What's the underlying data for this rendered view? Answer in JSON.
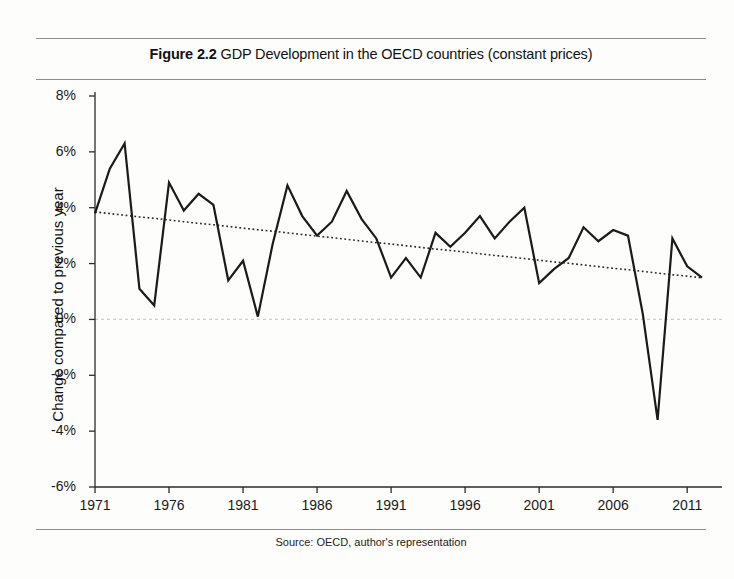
{
  "figure": {
    "number": "Figure 2.2",
    "caption": "GDP Development in the OECD countries (constant prices)",
    "source": "Source: OECD, author's representation"
  },
  "chart_data": {
    "type": "line",
    "title": "GDP Development in the OECD countries (constant prices)",
    "xlabel": "",
    "ylabel": "Change compared to previous year",
    "xlim": [
      1971,
      2012
    ],
    "ylim": [
      -6,
      8
    ],
    "ytick_labels": [
      "8%",
      "6%",
      "4%",
      "2%",
      "0%",
      "-2%",
      "-4%",
      "-6%"
    ],
    "ytick_values": [
      8,
      6,
      4,
      2,
      0,
      -2,
      -4,
      -6
    ],
    "xtick_labels": [
      "1971",
      "1976",
      "1981",
      "1986",
      "1991",
      "1996",
      "2001",
      "2006",
      "2011"
    ],
    "xtick_values": [
      1971,
      1976,
      1981,
      1986,
      1991,
      1996,
      2001,
      2006,
      2011
    ],
    "grid": "zero-line-only",
    "legend": "none",
    "x": [
      1971,
      1972,
      1973,
      1974,
      1975,
      1976,
      1977,
      1978,
      1979,
      1980,
      1981,
      1982,
      1983,
      1984,
      1985,
      1986,
      1987,
      1988,
      1989,
      1990,
      1991,
      1992,
      1993,
      1994,
      1995,
      1996,
      1997,
      1998,
      1999,
      2000,
      2001,
      2002,
      2003,
      2004,
      2005,
      2006,
      2007,
      2008,
      2009,
      2010,
      2011,
      2012
    ],
    "series": [
      {
        "name": "Change compared to previous year",
        "style": "solid",
        "color": "#1a1a1a",
        "values": [
          3.8,
          5.4,
          6.3,
          1.1,
          0.5,
          4.9,
          3.9,
          4.5,
          4.1,
          1.4,
          2.1,
          0.1,
          2.7,
          4.8,
          3.7,
          3.0,
          3.5,
          4.6,
          3.6,
          2.9,
          1.5,
          2.2,
          1.5,
          3.1,
          2.6,
          3.1,
          3.7,
          2.9,
          3.5,
          4.0,
          1.3,
          1.8,
          2.2,
          3.3,
          2.8,
          3.2,
          3.0,
          0.2,
          -3.6,
          2.9,
          1.9,
          1.5
        ]
      },
      {
        "name": "Linear trend",
        "style": "dotted",
        "color": "#2b2b2b",
        "values": [
          3.85,
          3.79,
          3.73,
          3.67,
          3.62,
          3.56,
          3.5,
          3.44,
          3.39,
          3.33,
          3.27,
          3.21,
          3.16,
          3.1,
          3.04,
          2.98,
          2.93,
          2.87,
          2.81,
          2.75,
          2.7,
          2.64,
          2.58,
          2.52,
          2.47,
          2.41,
          2.35,
          2.29,
          2.24,
          2.18,
          2.12,
          2.06,
          2.01,
          1.95,
          1.89,
          1.83,
          1.78,
          1.72,
          1.66,
          1.6,
          1.55,
          1.49
        ]
      }
    ],
    "zero_line": {
      "value": 0,
      "color": "#cfcfcf",
      "style": "dashed"
    }
  },
  "colors": {
    "series_line": "#1a1a1a",
    "trend_line": "#2b2b2b",
    "zero_line": "#cfcfcf",
    "axis": "#2b2b2b",
    "rule": "#8d8d8d",
    "background": "#fdfdfb"
  }
}
